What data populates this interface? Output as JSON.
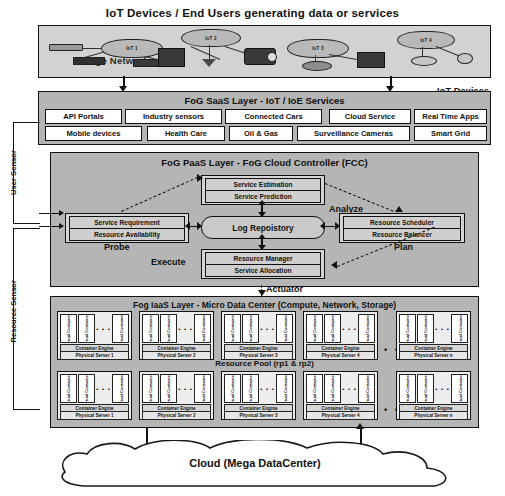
{
  "title": "IoT Devices / End Users generating data or services",
  "edge": {
    "label": "Edge Network",
    "devices_label": "IoT Devices",
    "clouds": [
      {
        "name": "IoT 1"
      },
      {
        "name": "IoT 2"
      },
      {
        "name": "IoT 3"
      },
      {
        "name": "IoT 4"
      }
    ]
  },
  "saas": {
    "title": "FoG SaaS Layer - IoT / IoE Services",
    "row1": [
      "API Portals",
      "Industry sensors",
      "Connected Cars",
      "Cloud Service",
      "Real Time Apps"
    ],
    "row2": [
      "Mobile devices",
      "Health Care",
      "Oil & Gas",
      "Surveillance Cameras",
      "Smart Grid"
    ]
  },
  "paas": {
    "title": "FoG PaaS Layer - FoG Cloud Controller (FCC)",
    "analyze": {
      "label": "Analyze",
      "rows": [
        "Service Estimation",
        "Service Prediction"
      ]
    },
    "probe": {
      "label": "Probe",
      "rows": [
        "Service  Requirement",
        "Resource Availability"
      ]
    },
    "plan": {
      "label": "Plan",
      "rows": [
        "Resource Scheduler",
        "Resource Balancer"
      ]
    },
    "execute": {
      "label": "Execute",
      "rows": [
        "Resource Manager",
        "Service Allocation"
      ]
    },
    "log_repository": "Log Repoistory",
    "actuator": "Actuator"
  },
  "iaas": {
    "title": "Fog IaaS Layer - Micro Data Center (Compute, Network, Storage)",
    "pool_label": "Resource Pool (rp1 & rp2)",
    "container_engine": "Container Engine",
    "vc_labels": [
      "Virtual Container1",
      "Virtual Container2",
      "Virtual Containern"
    ],
    "ellipsis": "• • •",
    "row_dots": "• • • • • •",
    "row1_servers": [
      "Physical Server 1",
      "Physical Server 2",
      "Physical Server 3",
      "Physical Server 4",
      "Physical Server n"
    ],
    "row2_servers": [
      "Physical Server 1",
      "Physical Server 2",
      "Physical Server 3",
      "Physical Server 4",
      "Physical Server n"
    ]
  },
  "sensors": {
    "user": "User  Sensor",
    "resource": "Resource Sensor"
  },
  "cloud": {
    "label": "Cloud  (Mega DataCenter)"
  },
  "colors": {
    "panel": "#b5b5b5",
    "edge": "#d2d2d2",
    "box": "#ffffff",
    "stroke": "#111111"
  }
}
